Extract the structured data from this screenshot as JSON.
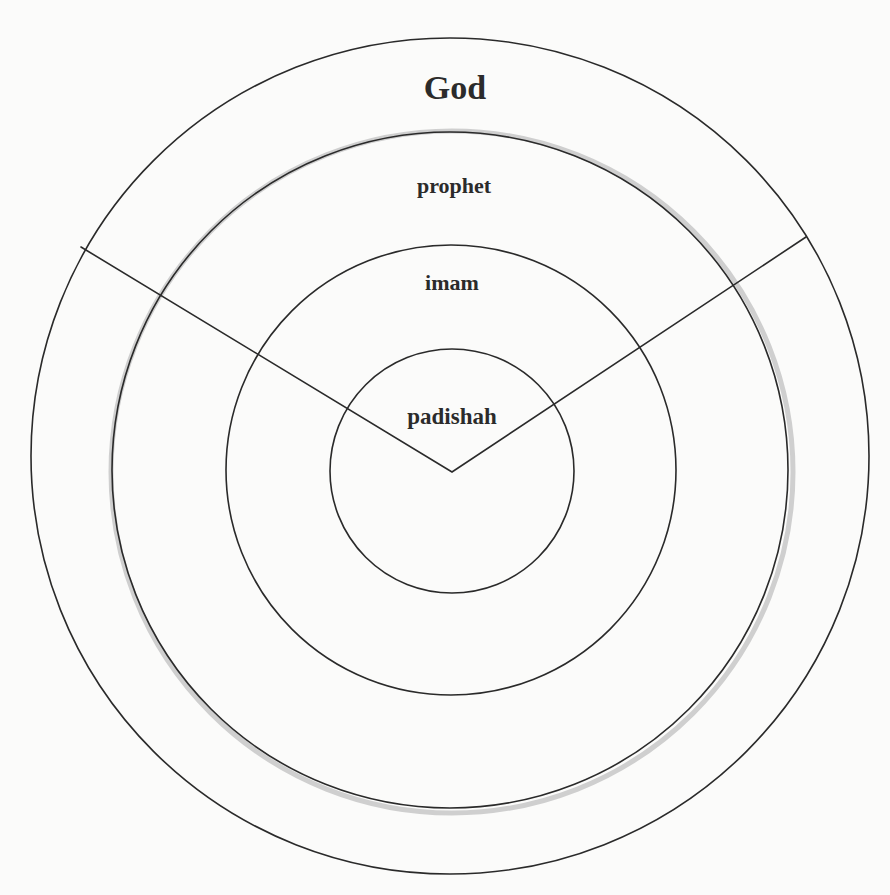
{
  "diagram": {
    "type": "concentric-hierarchy",
    "levels": [
      {
        "id": "god",
        "label": "God",
        "order": 1
      },
      {
        "id": "prophet",
        "label": "prophet",
        "order": 2
      },
      {
        "id": "imam",
        "label": "imam",
        "order": 3
      },
      {
        "id": "padishah",
        "label": "padishah",
        "order": 4
      }
    ],
    "colors": {
      "background": "#fbfbfa",
      "line": "#2a2a2a",
      "text": "#2b2b2b",
      "halo": "#cfcfcf"
    }
  }
}
